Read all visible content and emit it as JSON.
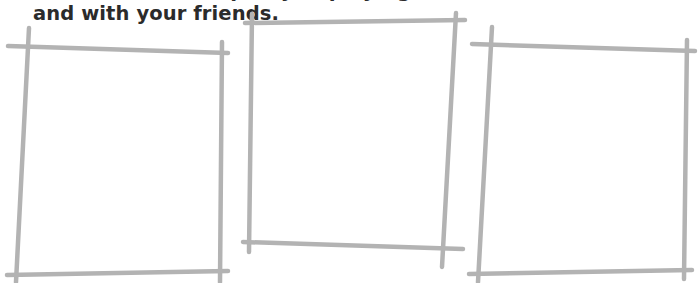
{
  "instruction": {
    "partial_line_above": "Draw a comic strip of you playing",
    "visible_line": "and with your friends."
  },
  "frames": [
    {
      "label": "panel-1"
    },
    {
      "label": "panel-2"
    },
    {
      "label": "panel-3"
    }
  ],
  "colors": {
    "frame_stroke": "#b3b3b3",
    "text": "#2b2b2b",
    "background": "#ffffff"
  }
}
